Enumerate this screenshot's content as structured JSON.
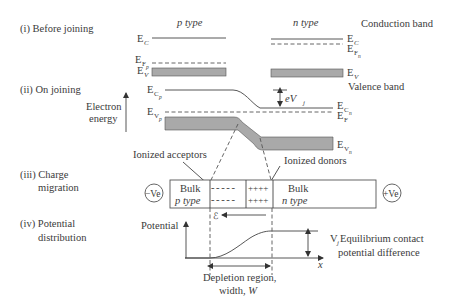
{
  "steps": {
    "before_joining": "(i) Before joining",
    "on_joining": "(ii) On joining",
    "charge_migration_1": "(iii) Charge",
    "charge_migration_2": "migration",
    "potential_distribution_1": "(iv) Potential",
    "potential_distribution_2": "distribution"
  },
  "headers": {
    "p_type": "p type",
    "n_type": "n type"
  },
  "band_labels": {
    "conduction_band": "Conduction band",
    "valence_band": "Valence band",
    "E": "E",
    "sub_C": "C",
    "sub_V": "V",
    "sub_F": "F",
    "sub_p": "p",
    "sub_n": "n"
  },
  "axis": {
    "electron_energy_1": "Electron",
    "electron_energy_2": "energy",
    "potential": "Potential",
    "x": "x"
  },
  "barrier": {
    "eVj_e": "eV",
    "eVj_sub": "j"
  },
  "charge": {
    "ionized_acceptors": "Ionized acceptors",
    "ionized_donors": "Ionized donors",
    "bulk_p_1": "Bulk",
    "bulk_p_2": "p type",
    "bulk_n_1": "Bulk",
    "bulk_n_2": "n type",
    "acceptor_row_1": "- - - - -",
    "acceptor_row_2": "- - - - -",
    "donor_row_1": "++++",
    "donor_row_2": "++++",
    "neg_terminal": "−Ve",
    "pos_terminal": "+Ve",
    "field_symbol": "ℰ"
  },
  "potential": {
    "vj_label": "V",
    "vj_sub": "j",
    "vj_desc_1": " Equilibrium contact",
    "vj_desc_2": "potential difference",
    "depletion_1": "Depletion region,",
    "depletion_2": "width, ",
    "depletion_W": "W"
  },
  "colors": {
    "band_fill": "#a9a9a9",
    "line": "#444444",
    "text": "#3a3a3a"
  }
}
